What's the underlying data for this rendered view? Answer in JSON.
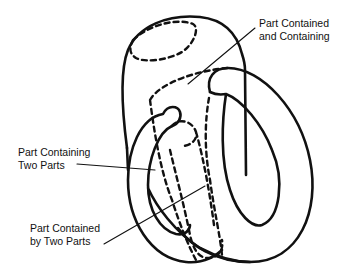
{
  "diagram": {
    "type": "mereology-illustration",
    "colors": {
      "stroke": "#111111",
      "background": "#ffffff"
    },
    "labels": {
      "part_contained_and_containing": {
        "line1": "Part Contained",
        "line2": "and Containing"
      },
      "part_containing_two_parts": {
        "line1": "Part Containing",
        "line2": "Two Parts"
      },
      "part_contained_by_two_parts": {
        "line1": "Part Contained",
        "line2": "by Two Parts"
      }
    },
    "shapes": [
      {
        "name": "capsule-body",
        "style": "solid"
      },
      {
        "name": "right-ring",
        "style": "solid"
      },
      {
        "name": "left-ring",
        "style": "solid"
      },
      {
        "name": "top-hidden-ellipse",
        "style": "dashed"
      },
      {
        "name": "inner-contained-tube",
        "style": "dashed"
      },
      {
        "name": "innermost-part",
        "style": "dashed"
      }
    ]
  }
}
